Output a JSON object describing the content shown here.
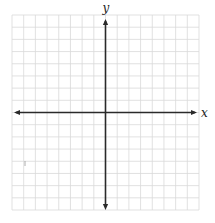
{
  "diagram": {
    "type": "coordinate-plane",
    "grid": {
      "columns": 16,
      "rows": 16,
      "left": 12,
      "top": 15,
      "right": 199,
      "bottom": 210,
      "line_color": "#d9d9d9"
    },
    "axes": {
      "color": "#2a2a2a",
      "x_axis": {
        "label": "x",
        "position_row_from_top": 8,
        "arrows": "both"
      },
      "y_axis": {
        "label": "y",
        "position_col_from_left": 8,
        "arrows": "both"
      }
    },
    "tick_labels_shown": false
  }
}
